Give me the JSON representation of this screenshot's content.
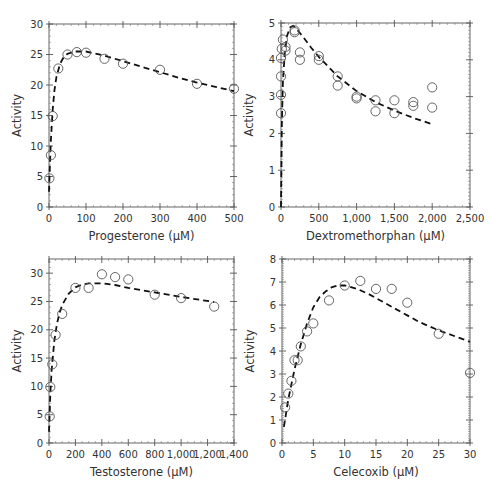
{
  "chart_data": [
    {
      "id": "progesterone",
      "type": "scatter",
      "title": "",
      "xlabel": "Progesterone (μM)",
      "ylabel": "Activity",
      "xlim": [
        0,
        500
      ],
      "ylim": [
        0,
        30
      ],
      "xticks": [
        0,
        100,
        200,
        300,
        400,
        500
      ],
      "xtick_labels": [
        "0",
        "100",
        "200",
        "300",
        "400",
        "500"
      ],
      "yticks": [
        0,
        5,
        10,
        15,
        20,
        25,
        30
      ],
      "ytick_labels": [
        "0",
        "5",
        "10",
        "15",
        "20",
        "25",
        "30"
      ],
      "grid": false,
      "series": [
        {
          "name": "observed",
          "kind": "scatter",
          "x": [
            1,
            5,
            10,
            25,
            50,
            75,
            100,
            150,
            200,
            300,
            400,
            500
          ],
          "y": [
            4.7,
            8.5,
            14.9,
            22.7,
            25.0,
            25.4,
            25.3,
            24.3,
            23.5,
            22.5,
            20.2,
            19.4
          ]
        },
        {
          "name": "fit",
          "kind": "line-dashed",
          "x": [
            0,
            2,
            5,
            10,
            15,
            20,
            30,
            40,
            50,
            70,
            100,
            150,
            200,
            250,
            300,
            350,
            400,
            450,
            500
          ],
          "y": [
            2.5,
            6.0,
            11.0,
            16.0,
            19.2,
            21.3,
            23.5,
            24.6,
            25.1,
            25.5,
            25.5,
            24.8,
            23.9,
            23.0,
            22.1,
            21.2,
            20.4,
            19.7,
            19.0
          ]
        }
      ]
    },
    {
      "id": "dextromethorphan",
      "type": "scatter",
      "title": "",
      "xlabel": "Dextromethorphan (μM)",
      "ylabel": "Activity",
      "xlim": [
        0,
        2500
      ],
      "ylim": [
        0,
        5
      ],
      "xticks": [
        0,
        500,
        1000,
        1500,
        2000,
        2500
      ],
      "xtick_labels": [
        "0",
        "500",
        "1,000",
        "1,500",
        "2,000",
        "2,500"
      ],
      "yticks": [
        0,
        1,
        2,
        3,
        4,
        5
      ],
      "ytick_labels": [
        "0",
        "1",
        "2",
        "3",
        "4",
        "5"
      ],
      "grid": false,
      "series": [
        {
          "name": "observed",
          "kind": "scatter",
          "x": [
            0,
            0,
            0,
            0,
            10,
            25,
            60,
            60,
            180,
            180,
            250,
            250,
            500,
            500,
            750,
            750,
            1000,
            1000,
            1250,
            1250,
            1500,
            1500,
            1750,
            1750,
            2000,
            2000
          ],
          "y": [
            2.55,
            3.05,
            3.55,
            4.05,
            4.3,
            4.55,
            4.25,
            4.35,
            4.75,
            4.8,
            4.2,
            4.0,
            4.1,
            4.0,
            3.55,
            3.3,
            3.0,
            2.95,
            2.9,
            2.6,
            2.9,
            2.55,
            2.85,
            2.75,
            3.25,
            2.7
          ]
        },
        {
          "name": "fit",
          "kind": "line-dashed",
          "x": [
            0,
            10,
            25,
            50,
            80,
            120,
            160,
            200,
            300,
            400,
            500,
            750,
            1000,
            1250,
            1500,
            1750,
            2000
          ],
          "y": [
            0,
            2.2,
            3.4,
            4.2,
            4.65,
            4.88,
            4.92,
            4.85,
            4.6,
            4.33,
            4.08,
            3.55,
            3.15,
            2.85,
            2.62,
            2.42,
            2.25
          ]
        }
      ]
    },
    {
      "id": "testosterone",
      "type": "scatter",
      "title": "",
      "xlabel": "Testosterone (μM)",
      "ylabel": "Activity",
      "xlim": [
        0,
        1400
      ],
      "ylim": [
        0,
        32.5
      ],
      "xticks": [
        0,
        200,
        400,
        600,
        800,
        1000,
        1200,
        1400
      ],
      "xtick_labels": [
        "0",
        "200",
        "400",
        "600",
        "800",
        "1,000",
        "1,200",
        "1,400"
      ],
      "yticks": [
        0,
        5,
        10,
        15,
        20,
        25,
        30
      ],
      "ytick_labels": [
        "0",
        "5",
        "10",
        "15",
        "20",
        "25",
        "30"
      ],
      "grid": false,
      "series": [
        {
          "name": "observed",
          "kind": "scatter",
          "x": [
            5,
            10,
            25,
            50,
            100,
            200,
            300,
            400,
            500,
            600,
            800,
            1000,
            1250
          ],
          "y": [
            4.7,
            9.9,
            13.9,
            19.1,
            22.8,
            27.4,
            27.4,
            29.8,
            29.3,
            28.9,
            26.2,
            25.6,
            24.1
          ]
        },
        {
          "name": "fit",
          "kind": "line-dashed",
          "x": [
            0,
            5,
            10,
            20,
            40,
            60,
            80,
            100,
            150,
            200,
            250,
            300,
            400,
            500,
            600,
            800,
            1000,
            1250
          ],
          "y": [
            2.0,
            5.5,
            8.5,
            12.8,
            18.0,
            21.0,
            23.0,
            24.4,
            26.4,
            27.5,
            28.0,
            28.2,
            28.2,
            27.9,
            27.4,
            26.6,
            25.8,
            24.9
          ]
        }
      ]
    },
    {
      "id": "celecoxib",
      "type": "scatter",
      "title": "",
      "xlabel": "Celecoxib (μM)",
      "ylabel": "Activity",
      "xlim": [
        0,
        30
      ],
      "ylim": [
        0,
        8
      ],
      "xticks": [
        0,
        5,
        10,
        15,
        20,
        25,
        30
      ],
      "xtick_labels": [
        "0",
        "5",
        "10",
        "15",
        "20",
        "25",
        "30"
      ],
      "yticks": [
        0,
        1,
        2,
        3,
        4,
        5,
        6,
        7,
        8
      ],
      "ytick_labels": [
        "0",
        "1",
        "2",
        "3",
        "4",
        "5",
        "6",
        "7",
        "8"
      ],
      "grid": false,
      "series": [
        {
          "name": "observed",
          "kind": "scatter",
          "x": [
            0.5,
            1,
            1.5,
            2,
            2.5,
            3,
            4,
            5,
            7.5,
            10,
            12.5,
            15,
            17.5,
            20,
            25,
            30
          ],
          "y": [
            1.55,
            2.15,
            2.7,
            3.6,
            3.6,
            4.2,
            4.85,
            5.2,
            6.2,
            6.85,
            7.05,
            6.7,
            6.7,
            6.1,
            4.75,
            3.05
          ]
        },
        {
          "name": "fit",
          "kind": "line-dashed",
          "x": [
            0.3,
            1,
            2,
            3,
            4,
            5,
            6,
            7,
            8,
            9,
            10,
            12,
            14,
            16,
            18,
            20,
            22,
            25,
            28,
            30
          ],
          "y": [
            0.7,
            1.9,
            3.2,
            4.3,
            5.2,
            5.9,
            6.35,
            6.6,
            6.78,
            6.85,
            6.85,
            6.7,
            6.45,
            6.15,
            5.85,
            5.55,
            5.25,
            4.9,
            4.6,
            4.4
          ]
        }
      ]
    }
  ]
}
